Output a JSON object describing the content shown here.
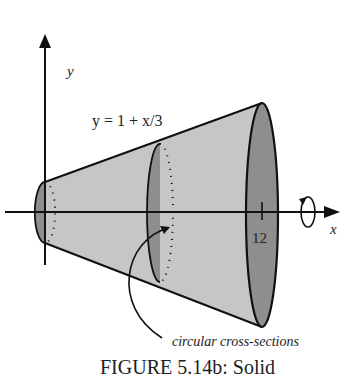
{
  "figure": {
    "caption": "FIGURE 5.14b: Solid",
    "equation": "y = 1 + x/3",
    "y_axis_label": "y",
    "x_axis_label": "x",
    "tick_label": "12",
    "annotation": "circular cross-sections",
    "colors": {
      "surface": "#c4c4c4",
      "disc": "#8e8e8e",
      "stroke": "#111111"
    }
  }
}
